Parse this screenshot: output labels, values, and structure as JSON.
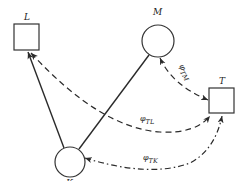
{
  "diagram": {
    "type": "network-graph",
    "nodes": [
      {
        "id": "L",
        "label": "L",
        "shape": "square"
      },
      {
        "id": "M",
        "label": "M",
        "shape": "circle"
      },
      {
        "id": "T",
        "label": "T",
        "shape": "square"
      },
      {
        "id": "K",
        "label": "K",
        "shape": "circle"
      }
    ],
    "edges": [
      {
        "id": "K-L",
        "from": "K",
        "to": "L",
        "style": "solid",
        "arrow": "end"
      },
      {
        "id": "K-M",
        "from": "K",
        "to": "M",
        "style": "solid",
        "arrow": "none"
      },
      {
        "id": "TL",
        "from": "T",
        "to": "L",
        "style": "dashed",
        "arrow": "both",
        "label_symbol": "φ",
        "label_sub": "TL"
      },
      {
        "id": "TM",
        "from": "T",
        "to": "M",
        "style": "dashed",
        "arrow": "both",
        "label_symbol": "φ",
        "label_sub": "TM"
      },
      {
        "id": "TK",
        "from": "T",
        "to": "K",
        "style": "dash-dot",
        "arrow": "both",
        "label_symbol": "φ",
        "label_sub": "TK"
      }
    ]
  }
}
